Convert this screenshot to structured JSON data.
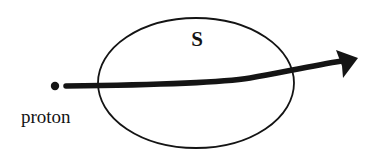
{
  "diagram": {
    "labels": {
      "surface": "S",
      "particle": "proton"
    },
    "colors": {
      "ink": "#141414",
      "background": "#ffffff"
    },
    "elements": {
      "surface_ellipse": {
        "cx": 196,
        "cy": 83,
        "rx": 98,
        "ry": 65,
        "stroke_width": 1.8
      },
      "proton_dot": {
        "cx": 55,
        "cy": 86,
        "r": 4.2
      },
      "trajectory": {
        "path": "M 66 86 C 150 85, 220 83, 250 78 S 310 66, 342 61",
        "stroke_width": 5.5
      },
      "arrowhead": {
        "points": "336,50 358,58 343,78 342,66"
      }
    }
  }
}
